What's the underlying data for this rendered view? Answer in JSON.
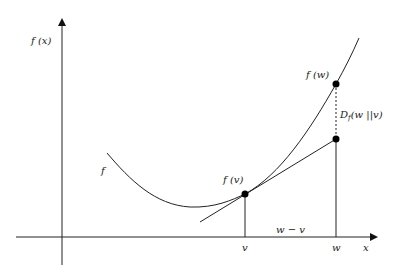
{
  "diagram": {
    "axes": {
      "y_label": "f (x)",
      "x_label": "x"
    },
    "curve_label": "f",
    "points": {
      "fv_label": "f (v)",
      "fw_label": "f (w)"
    },
    "ticks": {
      "v": "v",
      "w": "w"
    },
    "gap_label": "w − v",
    "divergence_label_main": "D",
    "divergence_label_sub": "f",
    "divergence_label_args": "(w ||v)",
    "colors": {
      "line": "#222222",
      "background": "#ffffff"
    }
  }
}
